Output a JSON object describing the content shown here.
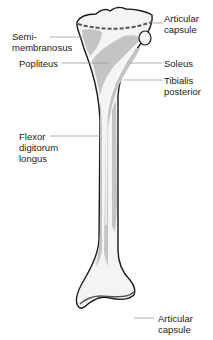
{
  "diagram": {
    "colors": {
      "background": "#ffffff",
      "bone_fill": "#f4f4f4",
      "attachment_fill": "#c4c4c4",
      "outline": "#1a1a1a",
      "leader_line": "#9a9a9a",
      "text": "#1a1a1a"
    },
    "labels": [
      {
        "id": "articular-capsule-top",
        "text": "Articular\ncapsule"
      },
      {
        "id": "semimembranosus",
        "text": "Semi-\nmembranosus"
      },
      {
        "id": "popliteus",
        "text": "Popliteus"
      },
      {
        "id": "soleus",
        "text": "Soleus"
      },
      {
        "id": "tibialis-posterior",
        "text": "Tibialis\nposterior"
      },
      {
        "id": "flexor-digitorum-longus",
        "text": "Flexor\ndigitorum\nlongus"
      },
      {
        "id": "articular-capsule-bottom",
        "text": "Articular\ncapsule"
      }
    ]
  }
}
